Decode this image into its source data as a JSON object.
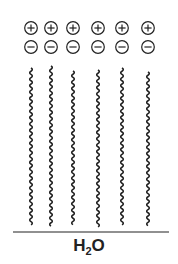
{
  "diagram": {
    "type": "monolayer-at-water-surface",
    "molecule_count": 6,
    "columns_x": [
      31,
      51,
      73,
      98,
      122,
      148
    ],
    "head_top_charge": "+",
    "head_bottom_charge": "−",
    "tail_style": "wavy",
    "subphase_label": {
      "main": "H",
      "sub": "2",
      "tail": "O"
    },
    "stroke_color": "#222222",
    "background": "#ffffff"
  }
}
